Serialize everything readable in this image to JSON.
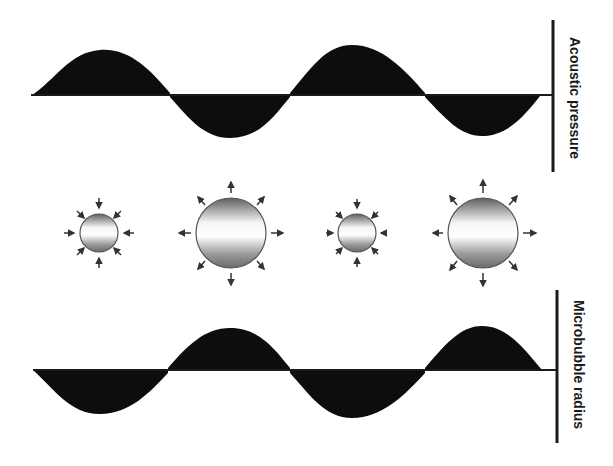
{
  "labels": {
    "top_axis": "Acoustic pressure",
    "bottom_axis": "Microbubble radius"
  },
  "colors": {
    "wave_fill": "#0d0d0d",
    "axis_line": "#1a1a1a",
    "bubble_edge": "#555555",
    "bubble_dark": "#6a6a6a",
    "bubble_light": "#ffffff",
    "arrow": "#333333"
  },
  "waves": {
    "acoustic_pressure": {
      "baseline_y": 95,
      "x_start": 31,
      "x_end": 545,
      "phase": "positive-first",
      "cycles": 2
    },
    "microbubble_radius": {
      "baseline_y": 370,
      "x_start": 33,
      "x_end": 545,
      "phase": "negative-first",
      "cycles": 2
    }
  },
  "bubbles": [
    {
      "state": "compressed",
      "cx": 99,
      "cy": 233,
      "r": 19,
      "arrows": "inward"
    },
    {
      "state": "expanded",
      "cx": 231,
      "cy": 233,
      "r": 35,
      "arrows": "outward"
    },
    {
      "state": "compressed",
      "cx": 357,
      "cy": 233,
      "r": 19,
      "arrows": "inward"
    },
    {
      "state": "expanded",
      "cx": 483,
      "cy": 233,
      "r": 35,
      "arrows": "outward"
    }
  ]
}
